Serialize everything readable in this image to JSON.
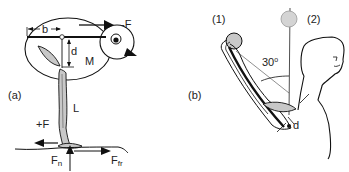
{
  "panel_a": {
    "label": "(a)",
    "labels": {
      "b": "b",
      "neg_f": "-F",
      "d": "d",
      "m": "M",
      "l": "L",
      "pos_f": "+F",
      "fn_main": "F",
      "fn_sub": "n",
      "ffr_main": "F",
      "ffr_sub": "fr"
    }
  },
  "panel_b": {
    "label": "(b)",
    "labels": {
      "pos1": "(1)",
      "pos2": "(2)",
      "angle_value": "30",
      "angle_unit": "o",
      "d": "d"
    }
  },
  "colors": {
    "stroke": "#111111",
    "fill_gray": "#c8c8c8",
    "fill_light_gray": "#d4d4d4",
    "background": "#ffffff"
  }
}
